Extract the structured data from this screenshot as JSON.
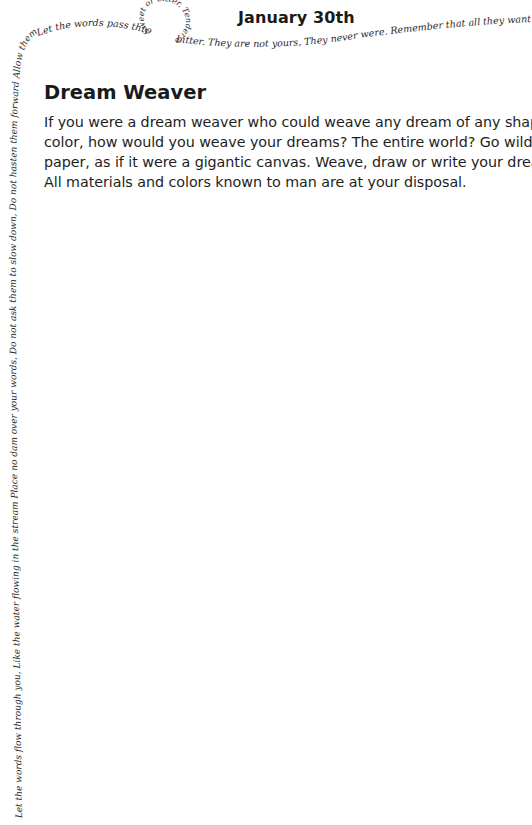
{
  "header": {
    "date": "January 30th"
  },
  "prompt": {
    "title": "Dream Weaver",
    "body_lines": [
      "If you were a dream weaver who could weave any dream of any shape or",
      "color, how would you weave your dreams? The entire world? Go wild on",
      "paper, as if it were a gigantic canvas. Weave, draw or write your dreams.",
      "All materials and colors known to man are at your disposal."
    ]
  },
  "border_text": {
    "left_vertical": "Let the words flow through you, Like the water flowing in the stream Place no dam over your words, Do not ask them to slow down, Do not hasten them forward Allow them to move freely As they are.",
    "top_horizontal_left": "Let the words pass through you, Peaceful and pleasant,",
    "spiral": "Sweet or bitter, Tender or harsh, perhaps",
    "top_horizontal_right": "bitter. They are not yours, They never were. Remember that all they want Is to reach their"
  },
  "colors": {
    "text": "#1a1a1a",
    "background": "#ffffff",
    "script": "#2a2a2a"
  }
}
